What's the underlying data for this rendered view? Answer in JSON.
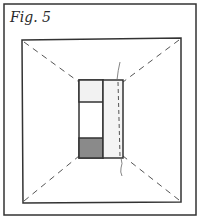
{
  "figure": {
    "label": "Fig. 5"
  },
  "diagram": {
    "outer_frame": {
      "x": 4,
      "y": 4,
      "w": 192,
      "h": 211
    },
    "inner_square": {
      "x1": 22,
      "y1": 38,
      "x2": 181,
      "y2": 202
    },
    "center_block": {
      "left_panel": {
        "x": 79,
        "y": 80,
        "w": 24,
        "h": 78
      },
      "right_strip": {
        "x": 103,
        "y": 80,
        "w": 20,
        "h": 78
      },
      "dividers_y": [
        102,
        138
      ],
      "top_cell_fill": "#f2f2f2",
      "bottom_cell_fill": "#8a8a8a",
      "strip_fill": "#f4f4f4"
    },
    "line_color": "#333333",
    "dashed_diagonals": true
  }
}
